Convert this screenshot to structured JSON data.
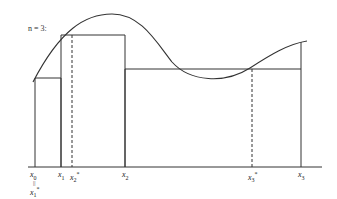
{
  "diagram": {
    "title": "n = 3:",
    "colors": {
      "stroke": "#333333",
      "background": "#ffffff"
    },
    "axis": {
      "y": 167,
      "x_start": 28,
      "x_end": 322
    },
    "points": [
      {
        "id": "x0",
        "name": "x",
        "sub": "0",
        "sup": "",
        "x": 35
      },
      {
        "id": "x1",
        "name": "x",
        "sub": "1",
        "sup": "",
        "x": 61
      },
      {
        "id": "x2star",
        "name": "x",
        "sub": "2",
        "sup": "*",
        "x": 72
      },
      {
        "id": "x2",
        "name": "x",
        "sub": "2",
        "sup": "",
        "x": 125
      },
      {
        "id": "x3star",
        "name": "x",
        "sub": "3",
        "sup": "*",
        "x": 252
      },
      {
        "id": "x3",
        "name": "x",
        "sub": "3",
        "sup": "",
        "x": 301
      }
    ],
    "x0_equals_label": {
      "eq": "||",
      "name": "x",
      "sub": "1",
      "sup": "*"
    },
    "rectangles": [
      {
        "x_left": 35,
        "x_right": 61,
        "top_y": 78,
        "sample": "x1*"
      },
      {
        "x_left": 61,
        "x_right": 125,
        "top_y": 35,
        "sample": "x2*"
      },
      {
        "x_left": 125,
        "x_right": 301,
        "top_y": 69,
        "sample": "x3*"
      }
    ],
    "curve": "M 33 82 C 60 30, 85 14, 112 14 C 140 14, 155 40, 172 62 C 190 82, 225 84, 250 68 C 270 55, 288 44, 307 41"
  },
  "labels": {
    "title": "n = 3:",
    "x0": "x",
    "x0_sub": "0",
    "x0_eq": "||",
    "x1star": "x",
    "x1star_sub": "1",
    "x1star_sup": "*",
    "x1": "x",
    "x1_sub": "1",
    "x2star": "x",
    "x2star_sub": "2",
    "x2star_sup": "*",
    "x2": "x",
    "x2_sub": "2",
    "x3star": "x",
    "x3star_sub": "3",
    "x3star_sup": "*",
    "x3": "x",
    "x3_sub": "3"
  }
}
